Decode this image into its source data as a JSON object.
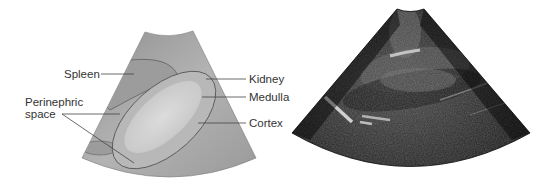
{
  "figure": {
    "left_panel": {
      "type": "schematic-diagram",
      "labels": {
        "spleen": "Spleen",
        "perinephric_line1": "Perinephric",
        "perinephric_line2": "space",
        "kidney": "Kidney",
        "medulla": "Medulla",
        "cortex": "Cortex"
      }
    },
    "right_panel": {
      "type": "ultrasound-image"
    },
    "colors": {
      "sector_fill": "#a6a6a6",
      "spleen_fill": "#9a9a9a",
      "kidney_fill": "#b9b9b9",
      "medulla_fill": "#d4d4d4",
      "outline": "#666666",
      "leader_line": "#444444",
      "label_text": "#333333",
      "ultrasound_bg": "#111111"
    }
  }
}
